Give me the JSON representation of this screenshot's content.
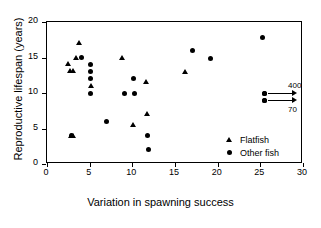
{
  "chart_data": {
    "type": "scatter",
    "title": "",
    "xlabel": "Variation in spawning success",
    "ylabel": "Reproductive lifespan (years)",
    "xlim": [
      0,
      30
    ],
    "ylim": [
      0,
      20
    ],
    "xticks": [
      0,
      5,
      10,
      15,
      20,
      25,
      30
    ],
    "yticks": [
      0,
      5,
      10,
      15,
      20
    ],
    "grid": false,
    "legend_position": "lower-right",
    "series": [
      {
        "name": "Flatfish",
        "marker": "triangle",
        "color": "#000000",
        "points": [
          {
            "x": 2.5,
            "y": 14.1
          },
          {
            "x": 2.7,
            "y": 13.1
          },
          {
            "x": 3.1,
            "y": 13.1
          },
          {
            "x": 2.8,
            "y": 4.0
          },
          {
            "x": 3.1,
            "y": 4.0
          },
          {
            "x": 3.4,
            "y": 15.0
          },
          {
            "x": 3.8,
            "y": 17.0
          },
          {
            "x": 5.1,
            "y": 11.0
          },
          {
            "x": 8.8,
            "y": 15.0
          },
          {
            "x": 10.1,
            "y": 5.5
          },
          {
            "x": 11.6,
            "y": 11.5
          },
          {
            "x": 11.7,
            "y": 7.0
          },
          {
            "x": 16.2,
            "y": 13.0
          }
        ]
      },
      {
        "name": "Other fish",
        "marker": "circle",
        "color": "#000000",
        "points": [
          {
            "x": 2.9,
            "y": 4.0
          },
          {
            "x": 4.1,
            "y": 15.0
          },
          {
            "x": 5.1,
            "y": 14.0
          },
          {
            "x": 5.1,
            "y": 13.0
          },
          {
            "x": 5.1,
            "y": 12.0
          },
          {
            "x": 5.1,
            "y": 10.0
          },
          {
            "x": 7.0,
            "y": 6.0
          },
          {
            "x": 9.1,
            "y": 10.0
          },
          {
            "x": 10.1,
            "y": 12.0
          },
          {
            "x": 10.2,
            "y": 10.0
          },
          {
            "x": 11.8,
            "y": 4.0
          },
          {
            "x": 11.9,
            "y": 2.0
          },
          {
            "x": 17.1,
            "y": 16.0
          },
          {
            "x": 19.2,
            "y": 14.9
          },
          {
            "x": 25.3,
            "y": 17.8
          },
          {
            "x": 25.5,
            "y": 10.0
          },
          {
            "x": 25.5,
            "y": 9.0
          }
        ]
      }
    ],
    "annotations": [
      {
        "label": "400",
        "type": "right-arrow",
        "from": {
          "x": 25.5,
          "y": 10.0
        },
        "label_position": "above-right",
        "meaning": "off-scale point, x = 400"
      },
      {
        "label": "70",
        "type": "right-arrow",
        "from": {
          "x": 25.5,
          "y": 9.0
        },
        "label_position": "below-right",
        "meaning": "off-scale point, x = 70"
      }
    ]
  },
  "legend": {
    "items": [
      {
        "label": "Flatfish",
        "marker": "triangle"
      },
      {
        "label": "Other fish",
        "marker": "circle"
      }
    ]
  },
  "axes": {
    "x": {
      "title": "Variation in spawning success",
      "tick_labels": [
        "0",
        "5",
        "10",
        "15",
        "20",
        "25",
        "30"
      ]
    },
    "y": {
      "title": "Reproductive lifespan (years)",
      "tick_labels": [
        "0",
        "5",
        "10",
        "15",
        "20"
      ]
    }
  }
}
